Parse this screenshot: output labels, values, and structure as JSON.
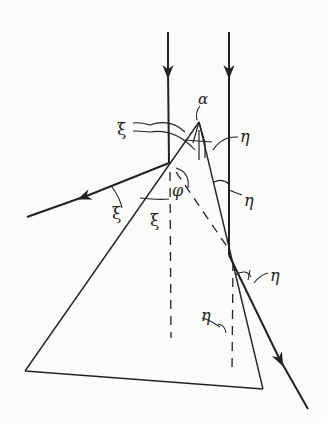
{
  "figure": {
    "colors": {
      "background": "#fbfbf9",
      "ink": "#222222"
    },
    "labels": {
      "alpha": "α",
      "xi_top": "ξ",
      "eta_top": "η",
      "eta_right_mid": "η",
      "phi": "φ",
      "xi_left_outer": "ξ",
      "xi_left_inner": "ξ",
      "eta_lower_left": "η",
      "eta_lower_right": "η"
    }
  }
}
